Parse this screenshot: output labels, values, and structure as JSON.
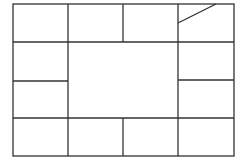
{
  "diagram": {
    "title": "",
    "stroke_color": "#333333",
    "outer_frame": {
      "x": 13,
      "y": 4,
      "w": 221,
      "h": 152
    },
    "lines": [
      {
        "id": "v-top-1",
        "x1": 68,
        "y1": 4,
        "x2": 68,
        "y2": 156
      },
      {
        "id": "v-top-2",
        "x1": 123,
        "y1": 4,
        "x2": 123,
        "y2": 42
      },
      {
        "id": "v-top-3",
        "x1": 178,
        "y1": 4,
        "x2": 178,
        "y2": 156
      },
      {
        "id": "h-top",
        "x1": 13,
        "y1": 42,
        "x2": 234,
        "y2": 42
      },
      {
        "id": "h-left-mid",
        "x1": 13,
        "y1": 81,
        "x2": 68,
        "y2": 81
      },
      {
        "id": "h-right-mid",
        "x1": 178,
        "y1": 80,
        "x2": 234,
        "y2": 80
      },
      {
        "id": "h-bottom",
        "x1": 13,
        "y1": 118,
        "x2": 234,
        "y2": 118
      },
      {
        "id": "v-bottom",
        "x1": 123,
        "y1": 118,
        "x2": 123,
        "y2": 156
      },
      {
        "id": "diagonal",
        "x1": 178,
        "y1": 23,
        "x2": 216,
        "y2": 4
      }
    ]
  }
}
